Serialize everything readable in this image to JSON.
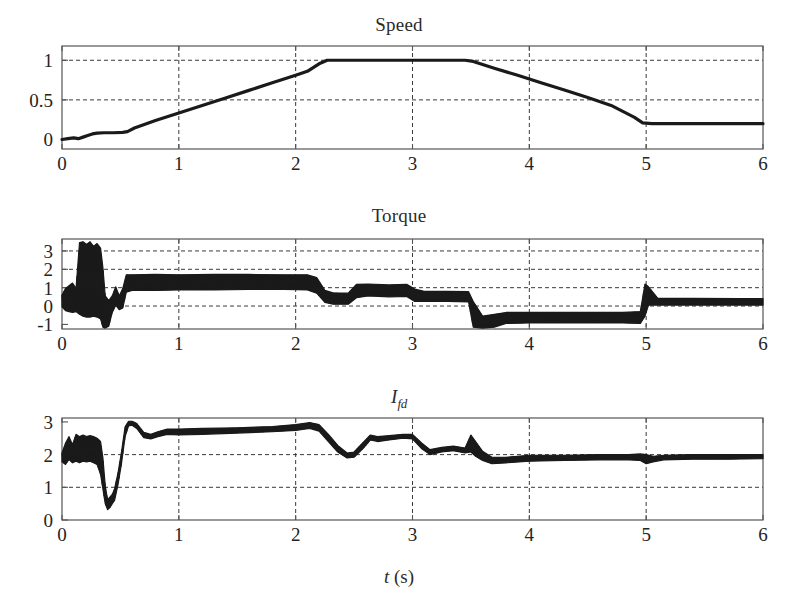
{
  "figure": {
    "background": "#ffffff",
    "ink_color": "#1a1a1a",
    "grid_color": "#3a3a3a",
    "frame_color": "#555555",
    "trace_color": "#1a1a1a"
  },
  "panels": [
    {
      "id": "speed",
      "title": "Speed",
      "title_parts": {
        "main": "Speed",
        "sub": ""
      },
      "xlabel": "",
      "x_ticks": [
        0,
        1,
        2,
        3,
        4,
        5,
        6
      ],
      "y_ticks": [
        0,
        0.5,
        1
      ],
      "y_tick_labels": [
        "0",
        "0.5",
        "1"
      ],
      "xlim": [
        0,
        6
      ],
      "ylim": [
        -0.12,
        1.18
      ],
      "grid_x_at": [
        1,
        2,
        3,
        4,
        5
      ],
      "grid_y_at": [
        0.5,
        1
      ]
    },
    {
      "id": "torque",
      "title": "Torque",
      "title_parts": {
        "main": "Torque",
        "sub": ""
      },
      "xlabel": "",
      "x_ticks": [
        0,
        1,
        2,
        3,
        4,
        5,
        6
      ],
      "y_ticks": [
        -1,
        0,
        1,
        2,
        3
      ],
      "y_tick_labels": [
        "-1",
        "0",
        "1",
        "2",
        "3"
      ],
      "xlim": [
        0,
        6
      ],
      "ylim": [
        -1.25,
        3.65
      ],
      "grid_x_at": [
        1,
        2,
        3,
        4,
        5
      ],
      "grid_y_at": [
        0,
        1,
        2,
        3
      ]
    },
    {
      "id": "ifd",
      "title": "I_fd",
      "title_parts": {
        "main": "I",
        "sub": "fd"
      },
      "xlabel": "t (s)",
      "xlabel_parts": {
        "var": "t",
        "unit": " (s)"
      },
      "x_ticks": [
        0,
        1,
        2,
        3,
        4,
        5,
        6
      ],
      "y_ticks": [
        0,
        1,
        2,
        3
      ],
      "y_tick_labels": [
        "0",
        "1",
        "2",
        "3"
      ],
      "xlim": [
        0,
        6
      ],
      "ylim": [
        0,
        3.12
      ],
      "grid_x_at": [
        1,
        2,
        3,
        4,
        5
      ],
      "grid_y_at": [
        1,
        2
      ]
    }
  ],
  "chart_data": [
    {
      "type": "line",
      "id": "speed",
      "title": "Speed",
      "xlabel": "t (s)",
      "ylabel": "Speed",
      "xlim": [
        0,
        6
      ],
      "ylim": [
        -0.12,
        1.18
      ],
      "grid": true,
      "legend": "none",
      "x_tick_labels": [
        "0",
        "1",
        "2",
        "3",
        "4",
        "5",
        "6"
      ],
      "y_tick_labels": [
        "0",
        "0.5",
        "1"
      ],
      "series": [
        {
          "name": "Speed",
          "color": "#1a1a1a",
          "points": [
            [
              0.0,
              0.0
            ],
            [
              0.05,
              0.01
            ],
            [
              0.1,
              0.02
            ],
            [
              0.14,
              0.01
            ],
            [
              0.18,
              0.03
            ],
            [
              0.22,
              0.05
            ],
            [
              0.26,
              0.07
            ],
            [
              0.3,
              0.08
            ],
            [
              0.36,
              0.085
            ],
            [
              0.44,
              0.085
            ],
            [
              0.52,
              0.09
            ],
            [
              0.56,
              0.1
            ],
            [
              0.62,
              0.145
            ],
            [
              0.8,
              0.24
            ],
            [
              1.0,
              0.335
            ],
            [
              1.2,
              0.43
            ],
            [
              1.4,
              0.525
            ],
            [
              1.6,
              0.62
            ],
            [
              1.8,
              0.715
            ],
            [
              2.0,
              0.81
            ],
            [
              2.1,
              0.86
            ],
            [
              2.2,
              0.955
            ],
            [
              2.27,
              1.0
            ],
            [
              2.4,
              1.0
            ],
            [
              2.8,
              1.0
            ],
            [
              3.2,
              1.0
            ],
            [
              3.45,
              1.0
            ],
            [
              3.52,
              0.985
            ],
            [
              3.7,
              0.9
            ],
            [
              3.9,
              0.81
            ],
            [
              4.1,
              0.715
            ],
            [
              4.3,
              0.625
            ],
            [
              4.5,
              0.53
            ],
            [
              4.7,
              0.43
            ],
            [
              4.9,
              0.28
            ],
            [
              4.97,
              0.21
            ],
            [
              5.05,
              0.2
            ],
            [
              5.4,
              0.2
            ],
            [
              5.8,
              0.2
            ],
            [
              6.0,
              0.2
            ]
          ]
        }
      ]
    },
    {
      "type": "line",
      "id": "torque",
      "title": "Torque",
      "xlabel": "t (s)",
      "ylabel": "Torque",
      "xlim": [
        0,
        6
      ],
      "ylim": [
        -1.25,
        3.65
      ],
      "grid": true,
      "legend": "none",
      "x_tick_labels": [
        "0",
        "1",
        "2",
        "3",
        "4",
        "5",
        "6"
      ],
      "y_tick_labels": [
        "-1",
        "0",
        "1",
        "2",
        "3"
      ],
      "note": "heavy high-frequency ripple; band values give ripple envelope min/max",
      "band": [
        [
          0.0,
          -0.05,
          0.6
        ],
        [
          0.03,
          -0.25,
          0.95
        ],
        [
          0.06,
          -0.3,
          1.1
        ],
        [
          0.09,
          -0.35,
          1.25
        ],
        [
          0.12,
          -0.3,
          0.95
        ],
        [
          0.15,
          -0.45,
          3.45
        ],
        [
          0.18,
          -0.55,
          3.5
        ],
        [
          0.21,
          -0.6,
          3.35
        ],
        [
          0.24,
          -0.6,
          3.5
        ],
        [
          0.27,
          -0.55,
          3.25
        ],
        [
          0.3,
          -0.6,
          3.4
        ],
        [
          0.33,
          -0.7,
          3.15
        ],
        [
          0.35,
          -1.15,
          2.1
        ],
        [
          0.37,
          -1.2,
          0.55
        ],
        [
          0.4,
          -1.1,
          0.3
        ],
        [
          0.43,
          -0.35,
          0.55
        ],
        [
          0.46,
          0.05,
          1.05
        ],
        [
          0.49,
          -0.2,
          0.55
        ],
        [
          0.52,
          -0.1,
          0.95
        ],
        [
          0.55,
          0.75,
          1.7
        ],
        [
          0.6,
          0.85,
          1.7
        ],
        [
          0.8,
          0.85,
          1.72
        ],
        [
          1.0,
          0.88,
          1.7
        ],
        [
          1.3,
          0.88,
          1.72
        ],
        [
          1.6,
          0.9,
          1.72
        ],
        [
          1.9,
          0.9,
          1.7
        ],
        [
          2.1,
          0.88,
          1.7
        ],
        [
          2.18,
          0.7,
          1.55
        ],
        [
          2.25,
          0.2,
          0.85
        ],
        [
          2.32,
          0.1,
          0.72
        ],
        [
          2.45,
          0.1,
          0.7
        ],
        [
          2.52,
          0.45,
          1.18
        ],
        [
          2.62,
          0.55,
          1.2
        ],
        [
          2.8,
          0.5,
          1.15
        ],
        [
          2.95,
          0.52,
          1.18
        ],
        [
          3.02,
          0.25,
          0.92
        ],
        [
          3.1,
          0.25,
          0.8
        ],
        [
          3.3,
          0.25,
          0.8
        ],
        [
          3.48,
          0.22,
          0.78
        ],
        [
          3.52,
          -1.15,
          0.25
        ],
        [
          3.6,
          -1.2,
          -0.55
        ],
        [
          3.7,
          -1.15,
          -0.45
        ],
        [
          3.8,
          -0.95,
          -0.35
        ],
        [
          4.0,
          -0.92,
          -0.35
        ],
        [
          4.4,
          -0.92,
          -0.35
        ],
        [
          4.8,
          -0.92,
          -0.35
        ],
        [
          4.95,
          -0.95,
          -0.3
        ],
        [
          4.99,
          -0.55,
          1.2
        ],
        [
          5.02,
          0.05,
          1.05
        ],
        [
          5.1,
          0.05,
          0.42
        ],
        [
          5.4,
          0.05,
          0.42
        ],
        [
          5.8,
          0.05,
          0.4
        ],
        [
          6.0,
          0.05,
          0.4
        ]
      ]
    },
    {
      "type": "line",
      "id": "ifd",
      "title": "I_fd",
      "xlabel": "t (s)",
      "ylabel": "I_fd",
      "xlim": [
        0,
        6
      ],
      "ylim": [
        0,
        3.12
      ],
      "grid": true,
      "legend": "none",
      "x_tick_labels": [
        "0",
        "1",
        "2",
        "3",
        "4",
        "5",
        "6"
      ],
      "y_tick_labels": [
        "0",
        "1",
        "2",
        "3"
      ],
      "note": "ripple band envelope min/max of field current",
      "band": [
        [
          0.0,
          1.78,
          2.05
        ],
        [
          0.03,
          1.7,
          2.35
        ],
        [
          0.06,
          1.85,
          2.55
        ],
        [
          0.09,
          1.75,
          2.3
        ],
        [
          0.12,
          1.8,
          2.62
        ],
        [
          0.15,
          1.75,
          2.55
        ],
        [
          0.18,
          1.8,
          2.6
        ],
        [
          0.21,
          1.78,
          2.55
        ],
        [
          0.24,
          1.8,
          2.58
        ],
        [
          0.27,
          1.75,
          2.55
        ],
        [
          0.3,
          1.7,
          2.5
        ],
        [
          0.33,
          1.4,
          2.4
        ],
        [
          0.35,
          0.95,
          1.9
        ],
        [
          0.37,
          0.5,
          1.05
        ],
        [
          0.39,
          0.32,
          0.62
        ],
        [
          0.41,
          0.38,
          0.7
        ],
        [
          0.43,
          0.5,
          0.78
        ],
        [
          0.45,
          0.6,
          0.95
        ],
        [
          0.48,
          1.1,
          1.45
        ],
        [
          0.51,
          1.75,
          2.1
        ],
        [
          0.54,
          2.55,
          2.85
        ],
        [
          0.57,
          2.88,
          3.02
        ],
        [
          0.6,
          2.9,
          3.02
        ],
        [
          0.64,
          2.8,
          2.95
        ],
        [
          0.7,
          2.52,
          2.68
        ],
        [
          0.76,
          2.48,
          2.62
        ],
        [
          0.82,
          2.55,
          2.7
        ],
        [
          0.9,
          2.62,
          2.78
        ],
        [
          1.0,
          2.6,
          2.78
        ],
        [
          1.2,
          2.62,
          2.8
        ],
        [
          1.5,
          2.66,
          2.82
        ],
        [
          1.8,
          2.7,
          2.86
        ],
        [
          2.0,
          2.74,
          2.92
        ],
        [
          2.12,
          2.8,
          2.98
        ],
        [
          2.2,
          2.72,
          2.92
        ],
        [
          2.28,
          2.4,
          2.62
        ],
        [
          2.36,
          2.08,
          2.28
        ],
        [
          2.44,
          1.9,
          2.05
        ],
        [
          2.5,
          1.92,
          2.08
        ],
        [
          2.58,
          2.2,
          2.38
        ],
        [
          2.64,
          2.45,
          2.6
        ],
        [
          2.7,
          2.4,
          2.55
        ],
        [
          2.8,
          2.45,
          2.58
        ],
        [
          2.92,
          2.5,
          2.62
        ],
        [
          3.0,
          2.48,
          2.62
        ],
        [
          3.08,
          2.18,
          2.35
        ],
        [
          3.15,
          2.0,
          2.15
        ],
        [
          3.25,
          2.08,
          2.22
        ],
        [
          3.35,
          2.12,
          2.26
        ],
        [
          3.45,
          2.05,
          2.2
        ],
        [
          3.5,
          2.08,
          2.6
        ],
        [
          3.54,
          1.95,
          2.4
        ],
        [
          3.6,
          1.82,
          2.1
        ],
        [
          3.68,
          1.72,
          1.92
        ],
        [
          3.8,
          1.75,
          1.92
        ],
        [
          4.0,
          1.8,
          1.98
        ],
        [
          4.3,
          1.82,
          1.98
        ],
        [
          4.6,
          1.84,
          2.0
        ],
        [
          4.85,
          1.84,
          2.0
        ],
        [
          4.95,
          1.82,
          2.02
        ],
        [
          5.0,
          1.72,
          2.0
        ],
        [
          5.06,
          1.78,
          1.95
        ],
        [
          5.15,
          1.84,
          1.98
        ],
        [
          5.4,
          1.86,
          2.0
        ],
        [
          5.7,
          1.86,
          2.0
        ],
        [
          6.0,
          1.88,
          2.0
        ]
      ]
    }
  ]
}
